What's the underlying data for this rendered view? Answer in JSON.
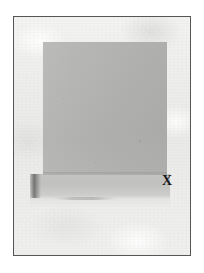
{
  "document": {
    "type": "photograph",
    "title": "Photograph of a gray panel on a light surface",
    "width_px": 204,
    "height_px": 273,
    "page_background": "#ffffff"
  },
  "frame": {
    "name": "photo-border",
    "border_color": "#575757",
    "border_width_px": 1,
    "left_px": 13,
    "top_px": 16,
    "width_px": 178,
    "height_px": 240
  },
  "scene": {
    "background": {
      "description": "mottled light gray paper texture",
      "color": "#ededec",
      "highlight_color": "#f5f5f4",
      "shade_color": "#dcdcda"
    },
    "panel": {
      "label": "gray panel",
      "color": "#b3b3b2",
      "shade_color": "#b0b0af",
      "left_px": 42,
      "top_px": 41,
      "width_px": 124,
      "height_px": 133
    },
    "base_plane": {
      "label": "base slab",
      "color": "#c0c0bf",
      "highlight_color": "#d7d7d6",
      "left_px": 29,
      "top_px": 173,
      "width_px": 140,
      "height_px": 23
    },
    "shadow": {
      "label": "cast shadow",
      "color": "#565654",
      "left_px": 29,
      "top_px": 173,
      "width_px": 11,
      "height_px": 24
    }
  },
  "annotations": [
    {
      "id": "point-x",
      "text": "X",
      "color": "#191919",
      "left_px": 161,
      "top_px": 173,
      "font_size_px": 14,
      "font_weight": "bold",
      "description": "bold serif X marking the lower-right corner of the panel"
    }
  ]
}
